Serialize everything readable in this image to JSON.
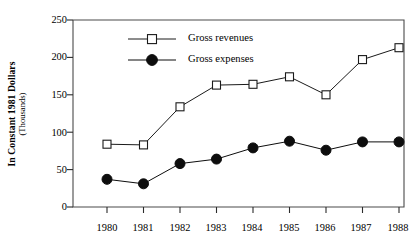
{
  "chart_data": {
    "type": "line",
    "title": "",
    "xlabel": "",
    "ylabel": "In Constant 1981 Dollars",
    "ylabel_sub": "(Thousands)",
    "categories": [
      "1980",
      "1981",
      "1982",
      "1983",
      "1984",
      "1985",
      "1986",
      "1987",
      "1988"
    ],
    "ylim": [
      0,
      250
    ],
    "yticks": [
      0,
      50,
      100,
      150,
      200,
      250
    ],
    "ytick_labels": [
      "0",
      "50",
      "100",
      "150",
      "200",
      "250"
    ],
    "grid": false,
    "legend_position": "upper left inside",
    "series": [
      {
        "name": "Gross revenues",
        "marker": "open-square",
        "color": "#1a1a1a",
        "values": [
          84,
          83,
          134,
          163,
          164,
          174,
          150,
          197,
          213
        ]
      },
      {
        "name": "Gross expenses",
        "marker": "filled-circle",
        "color": "#0d0d0d",
        "values": [
          37,
          31,
          58,
          64,
          79,
          88,
          76,
          87,
          87
        ]
      }
    ],
    "annotations": []
  },
  "legend": {
    "entries": [
      {
        "label": "Gross revenues",
        "marker": "open-square-marker"
      },
      {
        "label": "Gross expenses",
        "marker": "filled-circle-marker"
      }
    ]
  },
  "axes": {
    "frame_color": "#4a4a4a",
    "tick_color": "#2b2b2b"
  }
}
